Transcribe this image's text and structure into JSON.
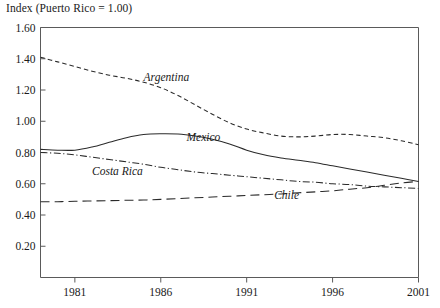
{
  "chart_data": {
    "type": "line",
    "title": "Index (Puerto Rico = 1.00)",
    "xlabel": "",
    "ylabel": "",
    "xlim": [
      1979,
      2001
    ],
    "ylim": [
      0.0,
      1.6
    ],
    "grid": false,
    "legend": "inline-labels",
    "x_ticks": [
      "1981",
      "1986",
      "1991",
      "1996",
      "2001"
    ],
    "x_tick_values": [
      1981,
      1986,
      1991,
      1996,
      2001
    ],
    "y_ticks": [
      "0.20",
      "0.40",
      "0.60",
      "0.80",
      "1.00",
      "1.20",
      "1.40",
      "1.60"
    ],
    "y_tick_values": [
      0.2,
      0.4,
      0.6,
      0.8,
      1.0,
      1.2,
      1.4,
      1.6
    ],
    "x": [
      1979,
      1980,
      1981,
      1982,
      1983,
      1984,
      1985,
      1986,
      1987,
      1988,
      1989,
      1990,
      1991,
      1992,
      1993,
      1994,
      1995,
      1996,
      1997,
      1998,
      1999,
      2000,
      2001
    ],
    "series": [
      {
        "name": "Argentina",
        "style": "dashed",
        "color": "#2a2a2a",
        "label_x": 1985.0,
        "label_y": 1.255,
        "values": [
          1.41,
          1.38,
          1.35,
          1.32,
          1.295,
          1.275,
          1.25,
          1.215,
          1.165,
          1.105,
          1.045,
          0.99,
          0.95,
          0.925,
          0.905,
          0.9,
          0.905,
          0.915,
          0.915,
          0.905,
          0.895,
          0.875,
          0.85
        ]
      },
      {
        "name": "Mexico",
        "style": "solid",
        "color": "#2a2a2a",
        "label_x": 1987.5,
        "label_y": 0.875,
        "values": [
          0.82,
          0.815,
          0.815,
          0.835,
          0.865,
          0.895,
          0.915,
          0.92,
          0.918,
          0.905,
          0.885,
          0.855,
          0.815,
          0.785,
          0.765,
          0.75,
          0.735,
          0.715,
          0.695,
          0.675,
          0.655,
          0.635,
          0.615
        ]
      },
      {
        "name": "Costa Rica",
        "style": "dash-dot",
        "color": "#2a2a2a",
        "label_x": 1982.0,
        "label_y": 0.655,
        "values": [
          0.8,
          0.795,
          0.785,
          0.77,
          0.755,
          0.74,
          0.725,
          0.705,
          0.69,
          0.675,
          0.665,
          0.655,
          0.645,
          0.635,
          0.625,
          0.615,
          0.61,
          0.6,
          0.595,
          0.585,
          0.58,
          0.575,
          0.57
        ]
      },
      {
        "name": "Chile",
        "style": "long-dash",
        "color": "#2a2a2a",
        "label_x": 1992.6,
        "label_y": 0.5,
        "values": [
          0.485,
          0.485,
          0.488,
          0.49,
          0.492,
          0.494,
          0.496,
          0.5,
          0.505,
          0.51,
          0.515,
          0.52,
          0.525,
          0.53,
          0.535,
          0.542,
          0.548,
          0.555,
          0.565,
          0.575,
          0.59,
          0.605,
          0.615
        ]
      }
    ]
  }
}
